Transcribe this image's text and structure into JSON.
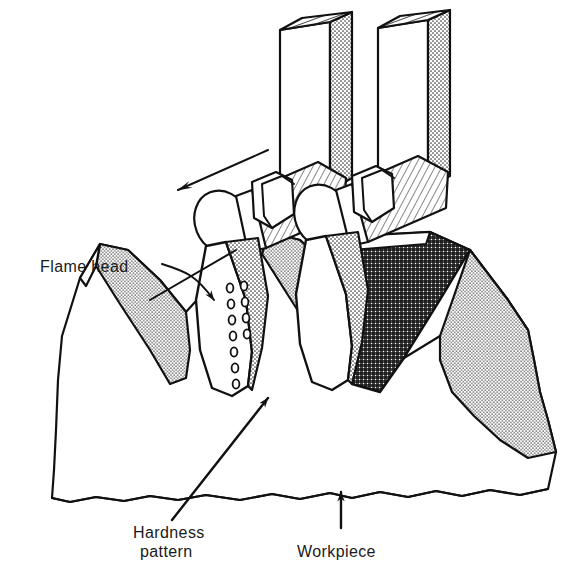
{
  "figure": {
    "background_color": "#ffffff",
    "line_color": "#111111",
    "labels": {
      "flame_head": "Flame head",
      "hardness_line1": "Hardness",
      "hardness_line2": "pattern",
      "workpiece": "Workpiece"
    },
    "annotations": {
      "travel_arrow_name": "travel-direction-arrow",
      "travel_arrow_direction": "down-left"
    },
    "colors": {
      "outline": "#111111",
      "stipple_fill": "#d8d8d8",
      "hardness_fill": "#4a4a4a",
      "white_face": "#ffffff"
    },
    "parts": {
      "gas_tubes": 2,
      "burner_cylinders": 2,
      "flame_heads": 2,
      "nozzle_hole_rows": 2,
      "nozzle_holes_total": 18,
      "gear_teeth_visible": 3
    }
  }
}
